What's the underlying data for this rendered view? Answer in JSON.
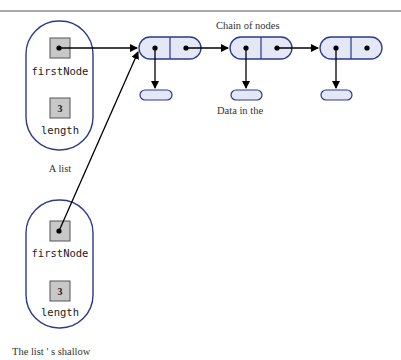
{
  "diagram": {
    "labels": {
      "chain_of_nodes": "Chain of nodes",
      "data_in_the": "Data in the",
      "a_list": "A  list",
      "shallow": "The  list ' s  shallow"
    },
    "list_original": {
      "first_node_label": "firstNode",
      "length_label": "length",
      "length_value": "3"
    },
    "list_copy": {
      "first_node_label": "firstNode",
      "length_label": "length",
      "length_value": "3"
    },
    "colors": {
      "outline": "#2b3a8c",
      "node_fill": "#e3e7f6",
      "box_fill": "#c8c8c8",
      "arrow": "#000000",
      "rule": "#555555"
    }
  }
}
